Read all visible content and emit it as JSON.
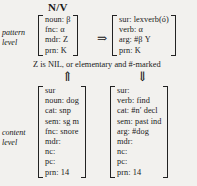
{
  "header": {
    "category": "N/V"
  },
  "labels": {
    "pattern_level": "pattern\nlevel",
    "content_level": "content\nlevel"
  },
  "condition": {
    "text": "Z is NIL, or elementary and #-marked"
  },
  "arrows": {
    "rule": "⇒",
    "up": "⇑",
    "down": "⇓"
  },
  "pattern_level": {
    "left_matrix": {
      "rows": [
        "noun: β",
        "fnc: α",
        "mdr: Z",
        "prn: K"
      ]
    },
    "right_matrix": {
      "rows": [
        "sur: lexverb(ó)",
        "verb: α",
        "arg: #β Y",
        "prn: K"
      ]
    }
  },
  "content_level": {
    "left_matrix": {
      "rows": [
        "sur",
        "noun: dog",
        "cat: snp",
        "sem: sg m",
        "fnc: snore",
        "mdr:",
        "nc:",
        "pc:",
        "prn: 14"
      ]
    },
    "right_matrix": {
      "rows": [
        "sur:",
        "verb: find",
        "cat: #n′ decl",
        "sem: past ind",
        "arg: #dog",
        "mdr:",
        "nc:",
        "pc:",
        "prn: 14"
      ]
    }
  },
  "colors": {
    "background": "#f2f1ee",
    "text": "#1a1a1a",
    "bracket": "#222222"
  }
}
